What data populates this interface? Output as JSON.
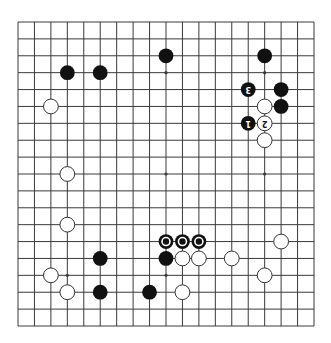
{
  "diagram": {
    "type": "go-board",
    "size": 19,
    "orientation_note": "diagram rendered rotated 180 degrees (move numbers appear upside-down)",
    "colors": {
      "background": "#ffffff",
      "grid_line": "#3a3a3a",
      "black_stone": "#111111",
      "white_stone": "#ffffff",
      "white_stone_outline": "#333333",
      "mark_ring": "#ffffff"
    },
    "geometry": {
      "x0": 18,
      "y0": 22,
      "x1": 314,
      "y1": 326
    },
    "star_points": [
      [
        3,
        3
      ],
      [
        9,
        3
      ],
      [
        15,
        3
      ],
      [
        3,
        9
      ],
      [
        9,
        9
      ],
      [
        15,
        9
      ],
      [
        3,
        15
      ],
      [
        9,
        15
      ],
      [
        15,
        15
      ]
    ],
    "stones": [
      {
        "color": "black",
        "col": 3,
        "row": 3
      },
      {
        "color": "black",
        "col": 5,
        "row": 3
      },
      {
        "color": "black",
        "col": 9,
        "row": 2
      },
      {
        "color": "black",
        "col": 15,
        "row": 2
      },
      {
        "color": "white",
        "col": 2,
        "row": 5
      },
      {
        "color": "black",
        "col": 14,
        "row": 4,
        "label": "3"
      },
      {
        "color": "black",
        "col": 16,
        "row": 4
      },
      {
        "color": "white",
        "col": 15,
        "row": 5
      },
      {
        "color": "black",
        "col": 16,
        "row": 5
      },
      {
        "color": "black",
        "col": 14,
        "row": 6,
        "label": "1"
      },
      {
        "color": "white",
        "col": 15,
        "row": 6,
        "label": "2"
      },
      {
        "color": "white",
        "col": 15,
        "row": 7
      },
      {
        "color": "white",
        "col": 3,
        "row": 9
      },
      {
        "color": "white",
        "col": 3,
        "row": 12
      },
      {
        "color": "black",
        "col": 9,
        "row": 13,
        "mark": "circle"
      },
      {
        "color": "black",
        "col": 10,
        "row": 13,
        "mark": "circle"
      },
      {
        "color": "black",
        "col": 11,
        "row": 13,
        "mark": "circle"
      },
      {
        "color": "white",
        "col": 16,
        "row": 13
      },
      {
        "color": "black",
        "col": 5,
        "row": 14
      },
      {
        "color": "black",
        "col": 9,
        "row": 14
      },
      {
        "color": "white",
        "col": 10,
        "row": 14
      },
      {
        "color": "white",
        "col": 11,
        "row": 14
      },
      {
        "color": "white",
        "col": 13,
        "row": 14
      },
      {
        "color": "white",
        "col": 2,
        "row": 15
      },
      {
        "color": "white",
        "col": 15,
        "row": 15
      },
      {
        "color": "white",
        "col": 3,
        "row": 16
      },
      {
        "color": "black",
        "col": 5,
        "row": 16
      },
      {
        "color": "black",
        "col": 8,
        "row": 16
      },
      {
        "color": "white",
        "col": 10,
        "row": 16
      }
    ]
  }
}
